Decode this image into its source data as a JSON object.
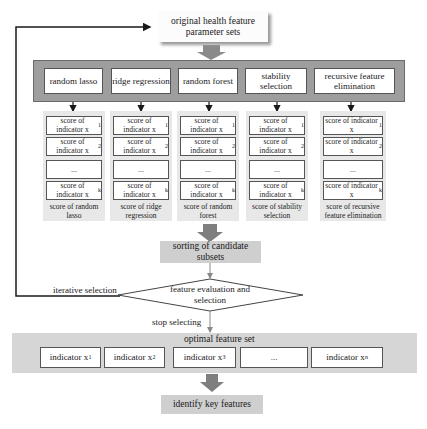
{
  "source": {
    "label": "original health feature parameter sets"
  },
  "methods": [
    {
      "label": "random lasso"
    },
    {
      "label": "ridge regression"
    },
    {
      "label": "random forest"
    },
    {
      "label": "stability selection"
    },
    {
      "label": "recursive feature elimination"
    }
  ],
  "score_columns": [
    {
      "items": [
        "score of indicator x",
        "score of indicator x",
        "...",
        "score of indicator x"
      ],
      "subs": [
        "1",
        "2",
        "",
        "k"
      ],
      "caption": "score of random lasso"
    },
    {
      "items": [
        "score of indicator x",
        "score of indicator x",
        "...",
        "score of indicator x"
      ],
      "subs": [
        "1",
        "2",
        "",
        "k"
      ],
      "caption": "score of ridge regression"
    },
    {
      "items": [
        "score of indicator x",
        "score of indicator x",
        "...",
        "score of indicator x"
      ],
      "subs": [
        "1",
        "2",
        "",
        "k"
      ],
      "caption": "score of random forest"
    },
    {
      "items": [
        "score of indicator x",
        "score of indicator x",
        "...",
        "score of indicator x"
      ],
      "subs": [
        "1",
        "2",
        "",
        "k"
      ],
      "caption": "score of stability selection"
    },
    {
      "items": [
        "score of indicator x",
        "score of indicator x",
        "...",
        "score of indicator x"
      ],
      "subs": [
        "1",
        "2",
        "",
        "k"
      ],
      "caption": "score of recursive feature elimination"
    }
  ],
  "sorting": {
    "label": "sorting of candidate subsets"
  },
  "decision": {
    "label": "feature evaluation and selection"
  },
  "edges": {
    "loop_label": "iterative selection",
    "stop_label": "stop selecting"
  },
  "optimal_set": {
    "title": "optimal feature set",
    "indicators": [
      {
        "text": "indicator x",
        "sub": "1"
      },
      {
        "text": "indicator x",
        "sub": "2"
      },
      {
        "text": "indicator x",
        "sub": "3"
      },
      {
        "text": "...",
        "sub": ""
      },
      {
        "text": "indicator x",
        "sub": "n"
      }
    ]
  },
  "result": {
    "label": "identify key features"
  },
  "colors": {
    "methods_panel": "#9e9e9e",
    "score_column_bg": "#e8e8e8",
    "grey_box": "#cfcfcf",
    "thick_arrow": "#7f7f7f",
    "line": "#1a1a1a"
  }
}
